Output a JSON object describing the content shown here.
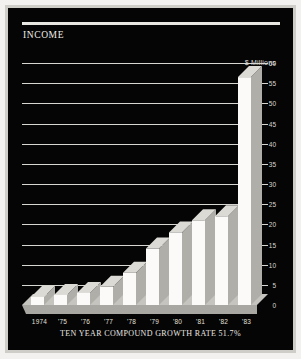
{
  "panel": {
    "title": "INCOME",
    "background_color": "#050505",
    "frame_color": "#cfcdc8",
    "rule_color": "#e9e7e2"
  },
  "footer": {
    "note": "TEN YEAR COMPOUND GROWTH RATE 51.7%"
  },
  "chart_data": {
    "type": "bar",
    "title": "INCOME",
    "subtitle": "",
    "unit_label": "$ Millions",
    "xlabel": "",
    "ylabel": "$ Millions",
    "categories": [
      "1974",
      "'75",
      "'76",
      "'77",
      "'78",
      "'79",
      "'80",
      "'81",
      "'82",
      "'83"
    ],
    "values": [
      2,
      2.5,
      3,
      4.5,
      8,
      14,
      18,
      21,
      22,
      56.5
    ],
    "ylim": [
      0,
      60
    ],
    "yticks": [
      0,
      5,
      10,
      15,
      20,
      25,
      30,
      35,
      40,
      45,
      50,
      55,
      60
    ],
    "ytick_labels": [
      "0",
      "5",
      "10",
      "15",
      "20",
      "25",
      "30",
      "35",
      "40",
      "45",
      "50",
      "55",
      "60"
    ],
    "grid": true,
    "grid_color": "#d8d6d1",
    "legend": "none",
    "bar_face_color": "#f7f6f3",
    "bar_side_color": "#b9b7b1",
    "annotation": "TEN YEAR COMPOUND GROWTH RATE 51.7%",
    "growth_rate": "51.7%"
  }
}
